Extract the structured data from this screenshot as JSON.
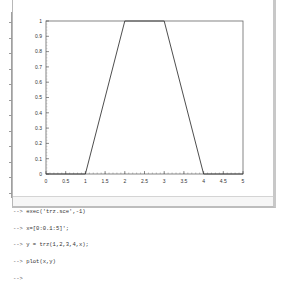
{
  "figure": {
    "chart_data": {
      "type": "line",
      "title": "",
      "xlabel": "",
      "ylabel": "",
      "x": [
        0,
        1,
        2,
        3,
        4,
        5
      ],
      "series": [
        {
          "name": "trz(1,2,3,4,x)",
          "values": [
            0,
            0,
            1,
            1,
            0,
            0
          ]
        }
      ],
      "xlim": [
        0,
        5
      ],
      "ylim": [
        0,
        1
      ],
      "x_ticks": [
        "0",
        "0.5",
        "1",
        "1.5",
        "2",
        "2.5",
        "3",
        "3.5",
        "4",
        "4.5",
        "5"
      ],
      "y_ticks": [
        "0",
        "0.1",
        "0.2",
        "0.3",
        "0.4",
        "0.5",
        "0.6",
        "0.7",
        "0.8",
        "0.9",
        "1"
      ],
      "grid": false,
      "line_color": "#000000"
    }
  },
  "console": {
    "prompt": "-->",
    "lines": [
      {
        "prompt": "-->",
        "command": " exec('trz.sce',-1)"
      },
      {
        "prompt": "-->",
        "command": " x=[0:0.1:5]';"
      },
      {
        "prompt": "-->",
        "command": " y = trz(1,2,3,4,x);"
      },
      {
        "prompt": "-->",
        "command": " plot(x,y)"
      },
      {
        "prompt": "-->",
        "command": ""
      }
    ]
  }
}
